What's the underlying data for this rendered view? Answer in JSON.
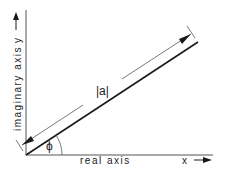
{
  "diagram": {
    "labels": {
      "real_axis": "real axis",
      "imaginary_axis": "imaginary axis",
      "x_symbol": "x",
      "y_symbol": "y",
      "magnitude": "|a|",
      "angle": "ϕ"
    },
    "colors": {
      "line": "#1a1a1a",
      "thin_line": "#555555",
      "background": "#ffffff"
    }
  }
}
